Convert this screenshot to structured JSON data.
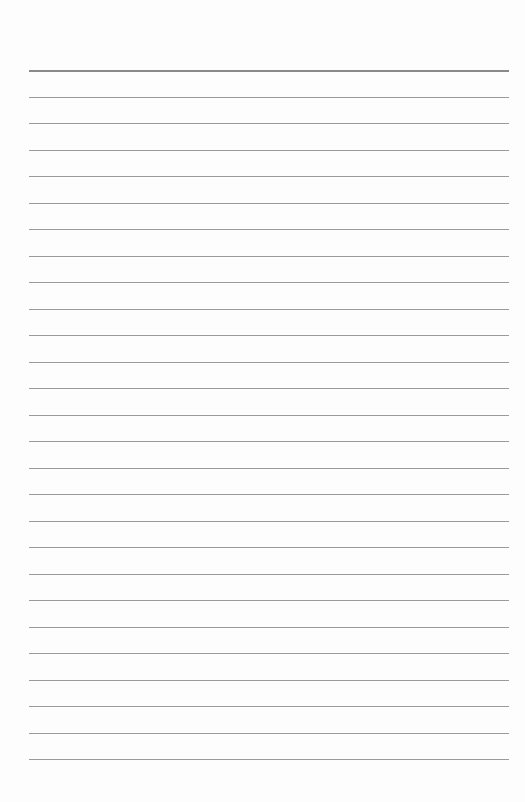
{
  "page": {
    "type": "lined-paper",
    "rule_count": 27,
    "header_rule": true,
    "rule_color": "#9a9a9a",
    "header_rule_color": "#8a8a8a",
    "background_color": "#fdfdfd"
  }
}
